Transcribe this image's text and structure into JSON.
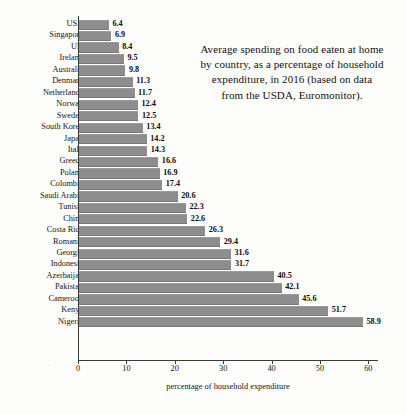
{
  "chart_data": {
    "type": "bar",
    "orientation": "horizontal",
    "title": "Average spending on food eaten at home by country, as a percentage of household expenditure, in 2016 (based on data from the USDA, Euromonitor).",
    "title_lines": [
      "Average spending on food eaten at home",
      "by country, as a percentage of household",
      "expenditure, in 2016 (based on data",
      "from the USDA, Euromonitor)."
    ],
    "xlabel": "percentage of household expenditure",
    "ylabel": "",
    "xlim": [
      0,
      62
    ],
    "xticks": [
      0,
      10,
      20,
      30,
      40,
      50,
      60
    ],
    "xtick_labels": [
      "0",
      "10",
      "20",
      "30",
      "40",
      "50",
      "60"
    ],
    "grid": false,
    "legend": false,
    "bar_color": "#8d8d8d",
    "axis_color": "#3a3a3a",
    "categories": [
      "USA",
      "Singapore",
      "UK",
      "Ireland",
      "Australia",
      "Denmark",
      "Netherlands",
      "Norway",
      "Sweden",
      "South Korea",
      "Japan",
      "Italy",
      "Greece",
      "Poland",
      "Colombia",
      "Saudi Arabia",
      "Tunisia",
      "China",
      "Costa Rica",
      "Romania",
      "Georgia",
      "Indonesia",
      "Azerbaijan",
      "Pakistan",
      "Cameroon",
      "Kenya",
      "Nigeria"
    ],
    "values": [
      6.4,
      6.9,
      8.4,
      9.5,
      9.8,
      11.3,
      11.7,
      12.4,
      12.5,
      13.4,
      14.2,
      14.3,
      16.6,
      16.9,
      17.4,
      20.6,
      22.3,
      22.6,
      26.3,
      29.4,
      31.6,
      31.7,
      40.5,
      42.1,
      45.6,
      51.7,
      58.9
    ],
    "value_labels": [
      "6.4",
      "6.9",
      "8.4",
      "9.5",
      "9.8",
      "11.3",
      "11.7",
      "12.4",
      "12.5",
      "13.4",
      "14.2",
      "14.3",
      "16.6",
      "16.9",
      "17.4",
      "20.6",
      "22.3",
      "22.6",
      "26.3",
      "29.4",
      "31.6",
      "31.7",
      "40.5",
      "42.1",
      "45.6",
      "51.7",
      "58.9"
    ]
  }
}
